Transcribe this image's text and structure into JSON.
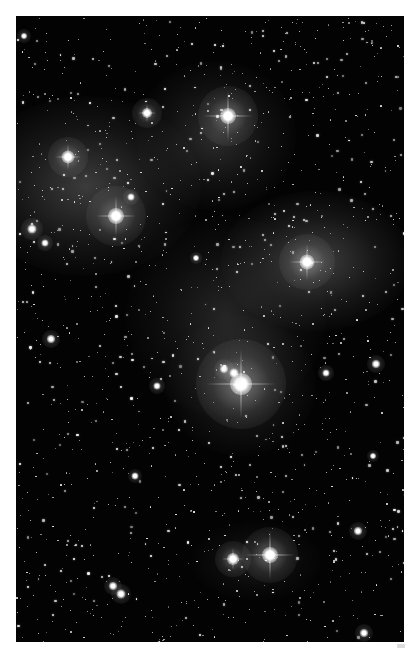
{
  "image": {
    "subject": "Pleiades star cluster (M45) with reflection nebulosity",
    "frame": {
      "border_color": "#ffffff",
      "background_color": "#030303",
      "left": 16,
      "top": 16,
      "width": 388,
      "height": 626
    },
    "nebulae": [
      {
        "name": "nebula-upper-left",
        "x": 70,
        "y": 170,
        "w": 230,
        "h": 180,
        "opacity": 0.3
      },
      {
        "name": "nebula-upper-center",
        "x": 200,
        "y": 120,
        "w": 160,
        "h": 150,
        "opacity": 0.22
      },
      {
        "name": "nebula-right",
        "x": 300,
        "y": 245,
        "w": 190,
        "h": 140,
        "opacity": 0.32
      },
      {
        "name": "nebula-center",
        "x": 210,
        "y": 300,
        "w": 200,
        "h": 200,
        "opacity": 0.18
      },
      {
        "name": "nebula-around-alcyone",
        "x": 225,
        "y": 370,
        "w": 150,
        "h": 140,
        "opacity": 0.2
      },
      {
        "name": "nebula-lower",
        "x": 240,
        "y": 545,
        "w": 130,
        "h": 80,
        "opacity": 0.12
      }
    ],
    "bright_stars": [
      {
        "name": "alcyone",
        "x": 225,
        "y": 368,
        "size": 22,
        "halo": 90,
        "spike": 70
      },
      {
        "name": "alcyone-companion",
        "x": 208,
        "y": 353,
        "size": 8,
        "halo": 20,
        "spike": 0
      },
      {
        "name": "alcyone-companion-2",
        "x": 218,
        "y": 357,
        "size": 9,
        "halo": 22,
        "spike": 0
      },
      {
        "name": "maia",
        "x": 212,
        "y": 100,
        "size": 16,
        "halo": 60,
        "spike": 50
      },
      {
        "name": "electra",
        "x": 100,
        "y": 200,
        "size": 16,
        "halo": 60,
        "spike": 40
      },
      {
        "name": "taygeta",
        "x": 131,
        "y": 97,
        "size": 10,
        "halo": 30,
        "spike": 18
      },
      {
        "name": "celaeno",
        "x": 52,
        "y": 141,
        "size": 13,
        "halo": 40,
        "spike": 26
      },
      {
        "name": "merope",
        "x": 291,
        "y": 246,
        "size": 15,
        "halo": 56,
        "spike": 36
      },
      {
        "name": "atlas",
        "x": 254,
        "y": 539,
        "size": 16,
        "halo": 56,
        "spike": 50
      },
      {
        "name": "pleione",
        "x": 217,
        "y": 543,
        "size": 12,
        "halo": 36,
        "spike": 22
      },
      {
        "name": "star-left-1",
        "x": 16,
        "y": 213,
        "size": 9,
        "halo": 22,
        "spike": 0
      },
      {
        "name": "star-left-2",
        "x": 29,
        "y": 227,
        "size": 7,
        "halo": 16,
        "spike": 0
      },
      {
        "name": "star-mid-1",
        "x": 115,
        "y": 181,
        "size": 7,
        "halo": 16,
        "spike": 0
      },
      {
        "name": "star-left-3",
        "x": 35,
        "y": 323,
        "size": 8,
        "halo": 18,
        "spike": 0
      },
      {
        "name": "star-mid-2",
        "x": 141,
        "y": 370,
        "size": 7,
        "halo": 16,
        "spike": 0
      },
      {
        "name": "star-mid-3",
        "x": 119,
        "y": 460,
        "size": 7,
        "halo": 14,
        "spike": 0
      },
      {
        "name": "star-right-1",
        "x": 310,
        "y": 357,
        "size": 7,
        "halo": 16,
        "spike": 0
      },
      {
        "name": "star-right-2",
        "x": 360,
        "y": 348,
        "size": 8,
        "halo": 18,
        "spike": 0
      },
      {
        "name": "star-right-3",
        "x": 342,
        "y": 515,
        "size": 8,
        "halo": 18,
        "spike": 0
      },
      {
        "name": "star-lower-left-1",
        "x": 97,
        "y": 570,
        "size": 8,
        "halo": 18,
        "spike": 0
      },
      {
        "name": "star-lower-left-2",
        "x": 105,
        "y": 578,
        "size": 9,
        "halo": 20,
        "spike": 0
      },
      {
        "name": "star-bottom-right",
        "x": 348,
        "y": 617,
        "size": 8,
        "halo": 18,
        "spike": 0
      },
      {
        "name": "star-top-left",
        "x": 8,
        "y": 20,
        "size": 6,
        "halo": 14,
        "spike": 0
      },
      {
        "name": "star-center-1",
        "x": 180,
        "y": 242,
        "size": 6,
        "halo": 12,
        "spike": 0
      },
      {
        "name": "star-right-4",
        "x": 357,
        "y": 440,
        "size": 6,
        "halo": 12,
        "spike": 0
      }
    ],
    "starfield": {
      "count": 1400,
      "seed": 45,
      "min_size": 1,
      "max_size": 2.6,
      "color": "#ffffff"
    }
  }
}
